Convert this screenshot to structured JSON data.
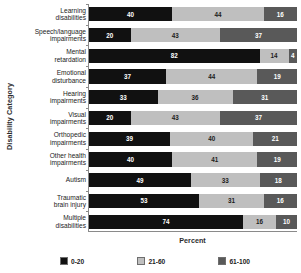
{
  "chart_data": {
    "type": "bar",
    "subtype": "horizontal-stacked-percent",
    "title": "",
    "xlabel": "Percent",
    "ylabel": "Disability Category",
    "xlim": [
      0,
      100
    ],
    "grid": false,
    "legend_position": "bottom",
    "categories": [
      "Learning\ndisabilities",
      "Speech/language\nimpairments",
      "Mental\nretardation",
      "Emotional\ndisturbance",
      "Hearing\nimpairments",
      "Visual\nimpairments",
      "Orthopedic\nimpairments",
      "Other health\nimpairments",
      "Autism",
      "Traumatic\nbrain injury",
      "Multiple\ndisabilities"
    ],
    "series": [
      {
        "name": "0-20",
        "color": "#111111",
        "values": [
          40,
          20,
          82,
          37,
          33,
          20,
          39,
          40,
          49,
          53,
          74
        ]
      },
      {
        "name": "21-60",
        "color": "#bfbfbf",
        "values": [
          44,
          43,
          14,
          44,
          36,
          43,
          40,
          41,
          33,
          31,
          16
        ]
      },
      {
        "name": "61-100",
        "color": "#595959",
        "values": [
          16,
          37,
          4,
          19,
          31,
          37,
          21,
          19,
          18,
          16,
          10
        ]
      }
    ]
  },
  "legend": {
    "items": [
      {
        "label": "0-20",
        "color": "#111111"
      },
      {
        "label": "21-60",
        "color": "#bfbfbf"
      },
      {
        "label": "61-100",
        "color": "#595959"
      }
    ]
  }
}
